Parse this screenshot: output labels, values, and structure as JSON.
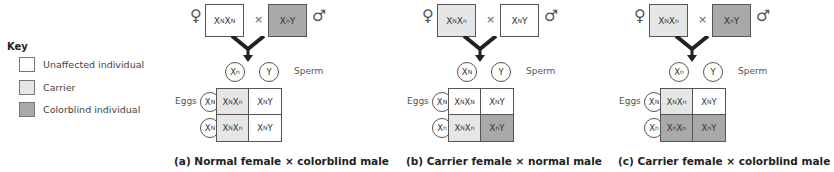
{
  "colors": {
    "unaffected": "#ffffff",
    "carrier": "#e6e6e6",
    "colorblind": "#a9a9a9"
  },
  "key": {
    "title": "Key",
    "items": [
      {
        "label": "Unaffected individual",
        "status": "unaffected"
      },
      {
        "label": "Carrier",
        "status": "carrier"
      },
      {
        "label": "Colorblind individual",
        "status": "colorblind"
      }
    ]
  },
  "labels": {
    "female_symbol": "♀",
    "male_symbol": "♂",
    "cross_symbol": "×",
    "sperm": "Sperm",
    "eggs": "Eggs"
  },
  "panels": [
    {
      "id": "a",
      "caption": "(a) Normal female × colorblind male",
      "female": {
        "base1": "X",
        "sup1": "N",
        "base2": "X",
        "sup2": "N",
        "suffix": "",
        "status": "unaffected"
      },
      "male": {
        "base1": "X",
        "sup1": "n",
        "suffix": "Y",
        "status": "colorblind"
      },
      "sperm": [
        {
          "base": "X",
          "sup": "n"
        },
        {
          "base": "Y",
          "sup": ""
        }
      ],
      "eggs": [
        {
          "base": "X",
          "sup": "N"
        },
        {
          "base": "X",
          "sup": "N"
        }
      ],
      "offspring": [
        [
          {
            "g1": "N",
            "g2": "n",
            "y": false,
            "status": "carrier"
          },
          {
            "g1": "N",
            "g2": "",
            "y": true,
            "status": "unaffected"
          }
        ],
        [
          {
            "g1": "N",
            "g2": "n",
            "y": false,
            "status": "carrier"
          },
          {
            "g1": "N",
            "g2": "",
            "y": true,
            "status": "unaffected"
          }
        ]
      ]
    },
    {
      "id": "b",
      "caption": "(b) Carrier female × normal male",
      "female": {
        "base1": "X",
        "sup1": "N",
        "base2": "X",
        "sup2": "n",
        "suffix": "",
        "status": "carrier"
      },
      "male": {
        "base1": "X",
        "sup1": "N",
        "suffix": "Y",
        "status": "unaffected"
      },
      "sperm": [
        {
          "base": "X",
          "sup": "N"
        },
        {
          "base": "Y",
          "sup": ""
        }
      ],
      "eggs": [
        {
          "base": "X",
          "sup": "N"
        },
        {
          "base": "X",
          "sup": "n"
        }
      ],
      "offspring": [
        [
          {
            "g1": "N",
            "g2": "N",
            "y": false,
            "status": "unaffected"
          },
          {
            "g1": "N",
            "g2": "",
            "y": true,
            "status": "unaffected"
          }
        ],
        [
          {
            "g1": "N",
            "g2": "n",
            "y": false,
            "status": "carrier"
          },
          {
            "g1": "n",
            "g2": "",
            "y": true,
            "status": "colorblind"
          }
        ]
      ]
    },
    {
      "id": "c",
      "caption": "(c) Carrier female × colorblind male",
      "female": {
        "base1": "X",
        "sup1": "N",
        "base2": "X",
        "sup2": "n",
        "suffix": "",
        "status": "carrier"
      },
      "male": {
        "base1": "X",
        "sup1": "n",
        "suffix": "Y",
        "status": "colorblind"
      },
      "sperm": [
        {
          "base": "X",
          "sup": "n"
        },
        {
          "base": "Y",
          "sup": ""
        }
      ],
      "eggs": [
        {
          "base": "X",
          "sup": "N"
        },
        {
          "base": "X",
          "sup": "n"
        }
      ],
      "offspring": [
        [
          {
            "g1": "N",
            "g2": "n",
            "y": false,
            "status": "carrier"
          },
          {
            "g1": "N",
            "g2": "",
            "y": true,
            "status": "unaffected"
          }
        ],
        [
          {
            "g1": "n",
            "g2": "n",
            "y": false,
            "status": "colorblind"
          },
          {
            "g1": "n",
            "g2": "",
            "y": true,
            "status": "colorblind"
          }
        ]
      ]
    }
  ]
}
